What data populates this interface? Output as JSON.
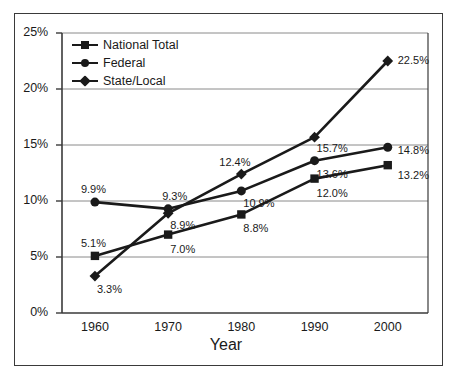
{
  "chart_data": {
    "type": "line",
    "title": "",
    "xlabel": "Year",
    "ylabel": "",
    "categories": [
      "1960",
      "1970",
      "1980",
      "1990",
      "2000"
    ],
    "x": [
      1960,
      1970,
      1980,
      1990,
      2000
    ],
    "ylim": [
      0,
      25
    ],
    "yticks": [
      "0%",
      "5%",
      "10%",
      "15%",
      "20%",
      "25%"
    ],
    "ytick_values": [
      0,
      5,
      10,
      15,
      20,
      25
    ],
    "grid": "horizontal",
    "legend_position": "top-left-inside",
    "series": [
      {
        "name": "National Total",
        "marker": "square",
        "color": "#1a1a1a",
        "values": [
          5.1,
          7.0,
          8.8,
          12.0,
          13.2
        ],
        "labels": [
          "5.1%",
          "7.0%",
          "8.8%",
          "12.0%",
          "13.2%"
        ]
      },
      {
        "name": "Federal",
        "marker": "circle",
        "color": "#1a1a1a",
        "values": [
          9.9,
          9.3,
          10.9,
          13.6,
          14.8
        ],
        "labels": [
          "9.9%",
          "9.3%",
          "10.9%",
          "13.6%",
          "14.8%"
        ]
      },
      {
        "name": "State/Local",
        "marker": "diamond",
        "color": "#1a1a1a",
        "values": [
          3.3,
          8.9,
          12.4,
          15.7,
          22.5
        ],
        "labels": [
          "3.3%",
          "8.9%",
          "12.4%",
          "15.7%",
          "22.5%"
        ]
      }
    ]
  },
  "axis": {
    "x_title": "Year",
    "y_ticks": [
      {
        "label": "25%"
      },
      {
        "label": "20%"
      },
      {
        "label": "15%"
      },
      {
        "label": "10%"
      },
      {
        "label": "5%"
      },
      {
        "label": "0%"
      }
    ],
    "x_ticks": [
      {
        "label": "1960"
      },
      {
        "label": "1970"
      },
      {
        "label": "1980"
      },
      {
        "label": "1990"
      },
      {
        "label": "2000"
      }
    ]
  },
  "legend": {
    "entries": [
      {
        "label": "National Total"
      },
      {
        "label": "Federal"
      },
      {
        "label": "State/Local"
      }
    ]
  },
  "point_labels": {
    "national_total": [
      "5.1%",
      "7.0%",
      "8.8%",
      "12.0%",
      "13.2%"
    ],
    "federal": [
      "9.9%",
      "9.3%",
      "10.9%",
      "13.6%",
      "14.8%"
    ],
    "state_local": [
      "3.3%",
      "8.9%",
      "12.4%",
      "15.7%",
      "22.5%"
    ]
  },
  "colors": {
    "line": "#1a1a1a",
    "grid": "#8a8a8a",
    "axis": "#3a3a3a",
    "frame": "#3a3a3a",
    "background": "#ffffff",
    "text": "#1a1a1a"
  }
}
